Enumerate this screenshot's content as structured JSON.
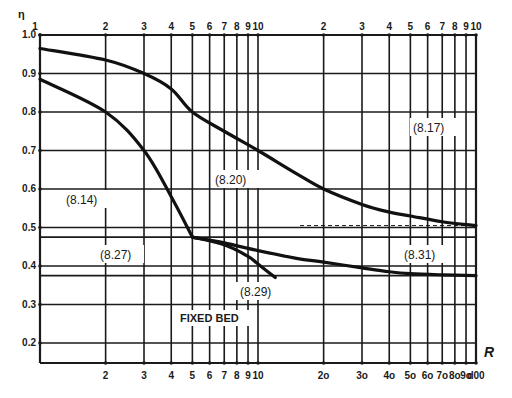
{
  "chart_data": {
    "type": "line",
    "title": "",
    "xlabel": "R",
    "ylabel": "η",
    "xscale": "log",
    "xlim": [
      1,
      100
    ],
    "ylim": [
      0.15,
      1.0
    ],
    "grid": true,
    "x_ticks_top": [
      "1",
      "2",
      "3",
      "4",
      "5",
      "6",
      "7",
      "8",
      "9",
      "10",
      "2",
      "3",
      "4",
      "5",
      "6",
      "7",
      "8",
      "9",
      "10"
    ],
    "x_ticks_bottom": [
      "2",
      "3",
      "4",
      "5",
      "6",
      "7",
      "8",
      "9",
      "10",
      "2o",
      "3o",
      "4o",
      "5o",
      "6o",
      "7o",
      "8o",
      "9o",
      "100"
    ],
    "y_ticks": [
      "1.0",
      "0.9",
      "0.8",
      "0.7",
      "0.6",
      "0.5",
      "0.4",
      "0.3",
      "0.2"
    ],
    "extra_hlines": [
      0.475,
      0.375
    ],
    "series": [
      {
        "name": "(8.17) / (8.20)",
        "x": [
          1,
          2,
          3,
          4,
          5,
          7,
          10,
          15,
          20,
          30,
          40,
          50,
          70,
          100
        ],
        "y": [
          0.965,
          0.935,
          0.9,
          0.86,
          0.8,
          0.75,
          0.7,
          0.64,
          0.6,
          0.56,
          0.54,
          0.53,
          0.515,
          0.505
        ]
      },
      {
        "name": "(8.14)",
        "x": [
          1,
          2,
          3,
          4,
          5
        ],
        "y": [
          0.885,
          0.8,
          0.7,
          0.58,
          0.475
        ]
      },
      {
        "name": "(8.27) / (8.31)",
        "x": [
          5,
          7,
          10,
          15,
          20,
          30,
          40,
          50,
          70,
          100
        ],
        "y": [
          0.475,
          0.46,
          0.44,
          0.42,
          0.41,
          0.395,
          0.385,
          0.38,
          0.377,
          0.375
        ]
      },
      {
        "name": "(8.29)",
        "x": [
          5,
          7,
          9,
          10,
          12
        ],
        "y": [
          0.475,
          0.455,
          0.425,
          0.405,
          0.37
        ]
      }
    ],
    "annotations": [
      "(8.14)",
      "(8.17)",
      "(8.20)",
      "(8.27)",
      "(8.29)",
      "(8.31)",
      "FIXED BED"
    ]
  },
  "labels": {
    "eta": "η",
    "r": "R",
    "a814": "(8.14)",
    "a817": "(8.17)",
    "a820": "(8.20)",
    "a827": "(8.27)",
    "a829": "(8.29)",
    "a831": "(8.31)",
    "fixed_bed": "FIXED BED"
  },
  "ticks": {
    "top": [
      "1",
      "2",
      "3",
      "4",
      "5",
      "6",
      "7",
      "8",
      "9",
      "10",
      "2",
      "3",
      "4",
      "5",
      "6",
      "7",
      "8",
      "9",
      "10"
    ],
    "bottom": [
      "2",
      "3",
      "4",
      "5",
      "6",
      "7",
      "8",
      "9",
      "10",
      "2o",
      "3o",
      "4o",
      "5o",
      "6o",
      "7o",
      "8o",
      "9o",
      "d00"
    ],
    "y": [
      "1.0",
      "0.9",
      "0.8",
      "0.7",
      "0.6",
      "0.5",
      "0.4",
      "0.3",
      "0.2"
    ]
  }
}
